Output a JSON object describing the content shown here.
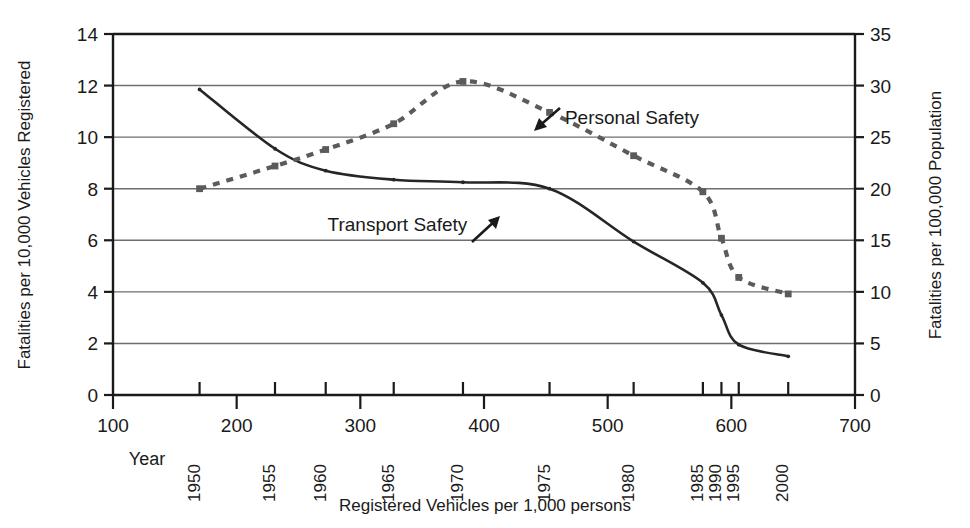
{
  "chart_data": {
    "type": "line",
    "title": "",
    "xlabel": "Registered Vehicles per 1,000 persons",
    "ylabel": "Fatalities per 10,000 Vehicles Registered",
    "y2label": "Fatalities per 100,000 Population",
    "xlim": [
      100,
      700
    ],
    "ylim": [
      0,
      14
    ],
    "y2lim": [
      0,
      35
    ],
    "xticks": [
      100,
      200,
      300,
      400,
      500,
      600,
      700
    ],
    "xticklabels": [
      "100",
      "200",
      "300",
      "400",
      "500",
      "600",
      "700"
    ],
    "yticks": [
      0,
      2,
      4,
      6,
      8,
      10,
      12,
      14
    ],
    "yticklabels": [
      "0",
      "2",
      "4",
      "6",
      "8",
      "10",
      "12",
      "14"
    ],
    "y2ticks": [
      0,
      5,
      10,
      15,
      20,
      25,
      30,
      35
    ],
    "y2ticklabels": [
      "0",
      "5",
      "10",
      "15",
      "20",
      "25",
      "30",
      "35"
    ],
    "grid": true,
    "grid_axis": "y",
    "legend_position": "inline-annotations",
    "secondary_axis_label_word": "Year",
    "year_axis": {
      "label": "Year",
      "ticks": [
        {
          "year": "1950",
          "x": 170
        },
        {
          "year": "1955",
          "x": 231
        },
        {
          "year": "1960",
          "x": 272
        },
        {
          "year": "1965",
          "x": 327
        },
        {
          "year": "1970",
          "x": 383
        },
        {
          "year": "1975",
          "x": 453
        },
        {
          "year": "1980",
          "x": 521
        },
        {
          "year": "1985",
          "x": 577
        },
        {
          "year": "1990",
          "x": 592
        },
        {
          "year": "1995",
          "x": 606
        },
        {
          "year": "2000",
          "x": 646
        }
      ]
    },
    "series": [
      {
        "name": "Transport Safety",
        "axis": "left",
        "style": "solid",
        "color": "#262626",
        "marker": "small-dot",
        "annotation": {
          "text": "Transport Safety",
          "arrow": "up-right",
          "x": 330,
          "y": 6.6
        },
        "points": [
          {
            "year": "1950",
            "x": 170,
            "y": 11.85
          },
          {
            "year": "1955",
            "x": 231,
            "y": 9.55
          },
          {
            "year": "1960",
            "x": 272,
            "y": 8.7
          },
          {
            "year": "1965",
            "x": 327,
            "y": 8.35
          },
          {
            "year": "1970",
            "x": 383,
            "y": 8.25
          },
          {
            "year": "1975",
            "x": 453,
            "y": 8.0
          },
          {
            "year": "1980",
            "x": 521,
            "y": 5.95
          },
          {
            "year": "1985",
            "x": 577,
            "y": 4.35
          },
          {
            "year": "1990",
            "x": 592,
            "y": 3.1
          },
          {
            "year": "1995",
            "x": 606,
            "y": 1.95
          },
          {
            "year": "2000",
            "x": 646,
            "y": 1.5
          }
        ]
      },
      {
        "name": "Personal Safety",
        "axis": "right",
        "style": "dashed",
        "color": "#5b5b5b",
        "marker": "square",
        "annotation": {
          "text": "Personal Safety",
          "arrow": "left",
          "x": 487,
          "y": 27.6
        },
        "points": [
          {
            "year": "1950",
            "x": 170,
            "y": 20.0
          },
          {
            "year": "1955",
            "x": 231,
            "y": 22.2
          },
          {
            "year": "1960",
            "x": 272,
            "y": 23.8
          },
          {
            "year": "1965",
            "x": 327,
            "y": 26.3
          },
          {
            "year": "1970",
            "x": 383,
            "y": 30.4
          },
          {
            "year": "1975",
            "x": 453,
            "y": 27.4
          },
          {
            "year": "1980",
            "x": 521,
            "y": 23.2
          },
          {
            "year": "1985",
            "x": 577,
            "y": 19.7
          },
          {
            "year": "1990",
            "x": 592,
            "y": 15.2
          },
          {
            "year": "1995",
            "x": 606,
            "y": 11.4
          },
          {
            "year": "2000",
            "x": 646,
            "y": 9.8
          }
        ]
      }
    ]
  },
  "axes": {
    "left_title": "Fatalities per 10,000 Vehicles Registered",
    "right_title": "Fatalities per 100,000 Population",
    "bottom_title": "Registered Vehicles per 1,000 persons",
    "year_row_title": "Year"
  },
  "labels": {
    "transport_safety": "Transport Safety",
    "personal_safety": "Personal Safety"
  },
  "colors": {
    "transport_line": "#262626",
    "personal_line": "#5b5b5b",
    "grid": "#6e6e6e",
    "axis": "#1a1a1a",
    "background": "#ffffff"
  }
}
